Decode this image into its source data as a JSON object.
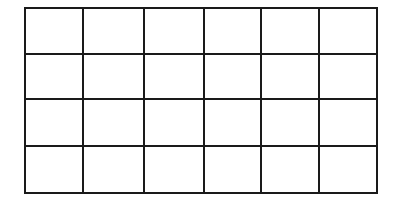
{
  "diagram": {
    "type": "empty-grid",
    "rows": 4,
    "columns": 6,
    "line_color": "#1a1a1a",
    "background_color": "#ffffff",
    "stroke_width": 2,
    "x_lines": [
      25,
      83,
      144,
      204,
      261,
      319,
      377
    ],
    "y_lines": [
      8,
      54,
      99,
      146,
      193
    ],
    "cells_filled": false
  }
}
